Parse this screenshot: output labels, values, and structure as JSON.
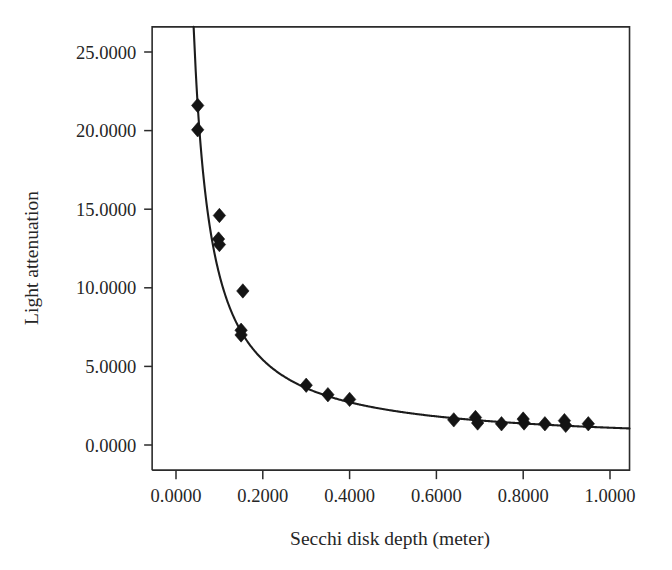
{
  "chart_data": {
    "type": "scatter",
    "title": "",
    "xlabel": "Secchi disk depth (meter)",
    "ylabel": "Light attenuation",
    "xlim": [
      -0.055,
      1.045
    ],
    "ylim": [
      -1.6,
      26.6
    ],
    "xticks": [
      0.0,
      0.2,
      0.4,
      0.6,
      0.8,
      1.0
    ],
    "xtick_labels": [
      "0.0000",
      "0.2000",
      "0.4000",
      "0.6000",
      "0.8000",
      "1.0000"
    ],
    "yticks": [
      0.0,
      5.0,
      10.0,
      15.0,
      20.0,
      25.0
    ],
    "ytick_labels": [
      "0.0000",
      "5.0000",
      "10.0000",
      "15.0000",
      "20.0000",
      "25.0000"
    ],
    "grid": false,
    "legend": null,
    "marker_style": "filled-diamond",
    "marker_color": "#141414",
    "curve_color": "#1c1c1c",
    "points": [
      {
        "x": 0.05,
        "y": 21.6
      },
      {
        "x": 0.05,
        "y": 20.05
      },
      {
        "x": 0.1,
        "y": 14.6
      },
      {
        "x": 0.098,
        "y": 13.1
      },
      {
        "x": 0.1,
        "y": 12.75
      },
      {
        "x": 0.154,
        "y": 9.8
      },
      {
        "x": 0.15,
        "y": 7.3
      },
      {
        "x": 0.15,
        "y": 7.0
      },
      {
        "x": 0.3,
        "y": 3.8
      },
      {
        "x": 0.35,
        "y": 3.2
      },
      {
        "x": 0.4,
        "y": 2.9
      },
      {
        "x": 0.64,
        "y": 1.6
      },
      {
        "x": 0.69,
        "y": 1.75
      },
      {
        "x": 0.695,
        "y": 1.4
      },
      {
        "x": 0.75,
        "y": 1.35
      },
      {
        "x": 0.8,
        "y": 1.65
      },
      {
        "x": 0.802,
        "y": 1.4
      },
      {
        "x": 0.85,
        "y": 1.35
      },
      {
        "x": 0.895,
        "y": 1.55
      },
      {
        "x": 0.898,
        "y": 1.25
      },
      {
        "x": 0.95,
        "y": 1.35
      }
    ],
    "fit_curve": {
      "model": "y = a / x + b",
      "a": 1.08,
      "b": 0.02,
      "x_start": 0.0455,
      "x_end": 1.045,
      "note": "hyperbolic decay fitted through scatter"
    }
  },
  "axes": {
    "x_title": "Secchi disk depth (meter)",
    "y_title": "Light attenuation"
  }
}
